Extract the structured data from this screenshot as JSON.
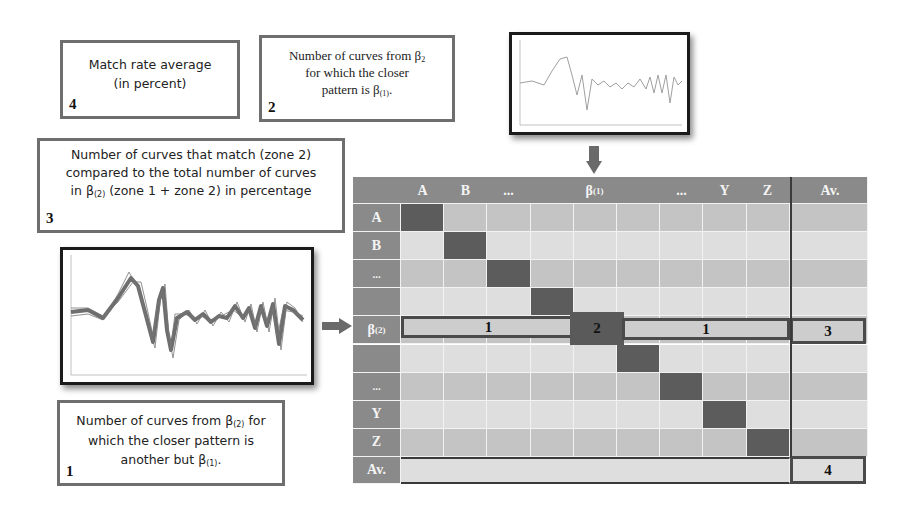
{
  "callouts": {
    "c4": {
      "number": "4",
      "line1": "Match rate average",
      "line2": "(in percent)"
    },
    "c2": {
      "number": "2",
      "line1": "Number of curves from β",
      "line1_sub": "2",
      "line2": "for which the closer",
      "line3": "pattern is β",
      "line3_sub": "(1)",
      "line3_end": "."
    },
    "c3": {
      "number": "3",
      "line1": "Number of curves that match (zone 2)",
      "line2": "compared to the total number of curves",
      "line3_pre": "in β",
      "line3_sub": "(2)",
      "line3_post": " (zone 1 + zone 2) in percentage"
    },
    "c1": {
      "number": "1",
      "line1_pre": "Number of curves from β",
      "line1_sub": "(2)",
      "line1_post": " for",
      "line2": "which the closer pattern is",
      "line3_pre": "another but β",
      "line3_sub": "(1)",
      "line3_post": "."
    }
  },
  "matrix": {
    "col_headers": [
      "A",
      "B",
      "...",
      "",
      "β(1)",
      "",
      "...",
      "Y",
      "Z"
    ],
    "avg_header": "Av.",
    "row_headers": [
      "A",
      "B",
      "...",
      "",
      "β(2)",
      "",
      "...",
      "Y",
      "Z"
    ],
    "avg_row_header": "Av.",
    "zone1_label": "1",
    "zone2_label": "2",
    "zone3_label": "3",
    "zone4_label": "4"
  },
  "colors": {
    "header": "#8a8a8a",
    "row_dark": "#c4c4c4",
    "row_light": "#dedede",
    "diagonal": "#5c5c5c",
    "border": "#6e6e6e"
  }
}
